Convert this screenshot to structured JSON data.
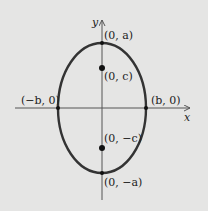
{
  "diagram": {
    "type": "ellipse-vertical-major-axis",
    "axes": {
      "x_label": "x",
      "y_label": "y"
    },
    "points": {
      "top_vertex": "(0, a)",
      "focus_upper": "(0, c)",
      "left_covertex": "(−b, 0)",
      "right_covertex": "(b, 0)",
      "focus_lower": "(0, −c)",
      "bottom_vertex": "(0, −a)"
    },
    "colors": {
      "background": "#e5e5e4",
      "ellipse": "#333333",
      "axes": "#555555",
      "points": "#111111"
    }
  }
}
